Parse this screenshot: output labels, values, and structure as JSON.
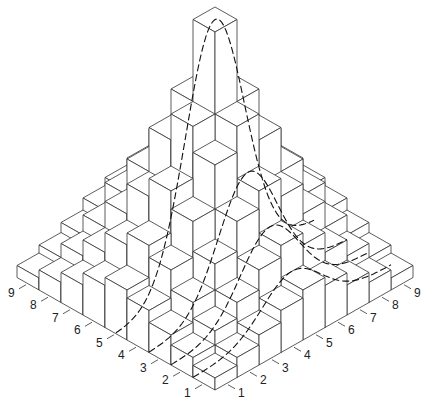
{
  "figure": {
    "type": "isometric-3d-histogram",
    "grid_size": 9,
    "left_axis_labels": [
      "1",
      "2",
      "3",
      "4",
      "5",
      "6",
      "7",
      "8",
      "9"
    ],
    "right_axis_labels": [
      "1",
      "2",
      "3",
      "4",
      "5",
      "6",
      "7",
      "8",
      "9"
    ],
    "line_color": "#333333",
    "curve_color": "#111111",
    "face_color": "#ffffff",
    "heights": [
      [
        12,
        20,
        30,
        42,
        50,
        42,
        30,
        20,
        12
      ],
      [
        20,
        34,
        50,
        70,
        82,
        70,
        50,
        34,
        20
      ],
      [
        30,
        50,
        76,
        106,
        124,
        106,
        76,
        50,
        30
      ],
      [
        42,
        70,
        106,
        150,
        176,
        150,
        106,
        70,
        42
      ],
      [
        50,
        82,
        124,
        176,
        258,
        176,
        124,
        82,
        50
      ],
      [
        42,
        70,
        106,
        150,
        176,
        150,
        106,
        70,
        42
      ],
      [
        30,
        50,
        76,
        106,
        124,
        106,
        76,
        50,
        30
      ],
      [
        20,
        34,
        50,
        70,
        82,
        70,
        50,
        34,
        20
      ],
      [
        12,
        20,
        30,
        42,
        50,
        42,
        30,
        20,
        12
      ]
    ],
    "dashed_curves_count": 4
  },
  "chart_data": {
    "type": "heatmap",
    "title": "",
    "xlabel": "",
    "ylabel": "",
    "x": [
      1,
      2,
      3,
      4,
      5,
      6,
      7,
      8,
      9
    ],
    "y": [
      1,
      2,
      3,
      4,
      5,
      6,
      7,
      8,
      9
    ],
    "values_relative_height": [
      [
        12,
        20,
        30,
        42,
        50,
        42,
        30,
        20,
        12
      ],
      [
        20,
        34,
        50,
        70,
        82,
        70,
        50,
        34,
        20
      ],
      [
        30,
        50,
        76,
        106,
        124,
        106,
        76,
        50,
        30
      ],
      [
        42,
        70,
        106,
        150,
        176,
        150,
        106,
        70,
        42
      ],
      [
        50,
        82,
        124,
        176,
        258,
        176,
        124,
        82,
        50
      ],
      [
        42,
        70,
        106,
        150,
        176,
        150,
        106,
        70,
        42
      ],
      [
        30,
        50,
        76,
        106,
        124,
        106,
        76,
        50,
        30
      ],
      [
        20,
        34,
        50,
        70,
        82,
        70,
        50,
        34,
        20
      ],
      [
        12,
        20,
        30,
        42,
        50,
        42,
        30,
        20,
        12
      ]
    ],
    "annotations": [
      "dashed conditional distribution curves drawn over rows"
    ]
  }
}
